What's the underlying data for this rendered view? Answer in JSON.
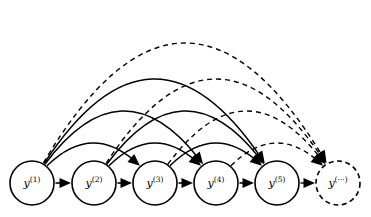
{
  "diagram": {
    "background_color": "#ffffff",
    "stroke_color": "#000000",
    "canvas": {
      "width": 371,
      "height": 217
    },
    "nodes": [
      {
        "id": "y1",
        "base": "y",
        "superscript": "(1)",
        "cx": 32,
        "cy": 183,
        "r": 22,
        "style": "solid"
      },
      {
        "id": "y2",
        "base": "y",
        "superscript": "(2)",
        "cx": 94,
        "cy": 183,
        "r": 22,
        "style": "solid"
      },
      {
        "id": "y3",
        "base": "y",
        "superscript": "(3)",
        "cx": 155,
        "cy": 183,
        "r": 22,
        "style": "solid"
      },
      {
        "id": "y4",
        "base": "y",
        "superscript": "(4)",
        "cx": 216,
        "cy": 183,
        "r": 22,
        "style": "solid"
      },
      {
        "id": "y5",
        "base": "y",
        "superscript": "(5)",
        "cx": 277,
        "cy": 183,
        "r": 22,
        "style": "solid"
      },
      {
        "id": "ydots",
        "base": "y",
        "superscript": "(···)",
        "cx": 338,
        "cy": 183,
        "r": 22,
        "style": "dashed"
      }
    ],
    "chain_edges": [
      {
        "from": "y1",
        "to": "y2",
        "style": "solid"
      },
      {
        "from": "y2",
        "to": "y3",
        "style": "solid"
      },
      {
        "from": "y3",
        "to": "y4",
        "style": "solid"
      },
      {
        "from": "y4",
        "to": "y5",
        "style": "solid"
      },
      {
        "from": "y5",
        "to": "ydots",
        "style": "dashed"
      }
    ],
    "skip_edges": [
      {
        "from": "y1",
        "to": "y3",
        "style": "solid",
        "height": 40
      },
      {
        "from": "y1",
        "to": "y4",
        "style": "solid",
        "height": 72
      },
      {
        "from": "y1",
        "to": "y5",
        "style": "solid",
        "height": 104
      },
      {
        "from": "y1",
        "to": "ydots",
        "style": "dashed",
        "height": 140
      },
      {
        "from": "y2",
        "to": "y4",
        "style": "solid",
        "height": 40
      },
      {
        "from": "y2",
        "to": "y5",
        "style": "solid",
        "height": 72
      },
      {
        "from": "y2",
        "to": "ydots",
        "style": "dashed",
        "height": 104
      },
      {
        "from": "y3",
        "to": "y5",
        "style": "solid",
        "height": 40
      },
      {
        "from": "y3",
        "to": "ydots",
        "style": "dashed",
        "height": 72
      },
      {
        "from": "y4",
        "to": "ydots",
        "style": "dashed",
        "height": 40
      }
    ]
  }
}
